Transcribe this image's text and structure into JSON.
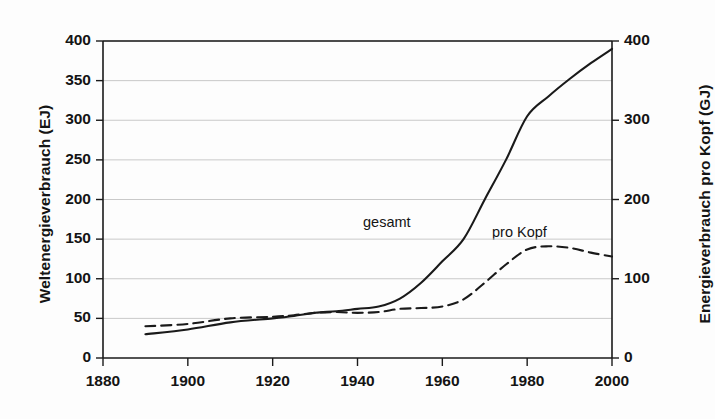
{
  "chart_data": {
    "type": "line",
    "title": "",
    "subtitle": "",
    "xlabel": "",
    "ylabel": "Weltenergieverbrauch (EJ)",
    "ylabel_right": "Energieverbrauch pro Kopf (GJ)",
    "xlim": [
      1880,
      2000
    ],
    "ylim": [
      0,
      400
    ],
    "ylim_right": [
      0,
      400
    ],
    "grid": true,
    "legend_position": "inline-annotations",
    "xticks": [
      "1880",
      "1900",
      "1920",
      "1940",
      "1960",
      "1980",
      "2000"
    ],
    "xtick_values": [
      1880,
      1900,
      1920,
      1940,
      1960,
      1980,
      2000
    ],
    "yticks_left": [
      "0",
      "50",
      "100",
      "150",
      "200",
      "250",
      "300",
      "350",
      "400"
    ],
    "ytick_values_left": [
      0,
      50,
      100,
      150,
      200,
      250,
      300,
      350,
      400
    ],
    "yticks_right": [
      "0",
      "100",
      "200",
      "300",
      "400"
    ],
    "ytick_values_right": [
      0,
      100,
      200,
      300,
      400
    ],
    "series": [
      {
        "name": "gesamt",
        "label": "gesamt",
        "axis": "left",
        "unit": "EJ",
        "style": "solid",
        "color": "#1a1a1a",
        "x": [
          1890,
          1900,
          1910,
          1920,
          1925,
          1930,
          1935,
          1940,
          1945,
          1950,
          1955,
          1960,
          1965,
          1970,
          1975,
          1980,
          1985,
          1990,
          1995,
          2000
        ],
        "values": [
          30,
          36,
          45,
          50,
          53,
          57,
          59,
          62,
          65,
          75,
          95,
          122,
          150,
          200,
          250,
          305,
          330,
          352,
          372,
          390
        ]
      },
      {
        "name": "pro Kopf",
        "label": "pro Kopf",
        "axis": "right",
        "unit": "GJ",
        "style": "dashed",
        "color": "#1a1a1a",
        "x": [
          1890,
          1900,
          1910,
          1920,
          1925,
          1930,
          1935,
          1940,
          1945,
          1950,
          1955,
          1960,
          1965,
          1970,
          1975,
          1980,
          1985,
          1990,
          1995,
          2000
        ],
        "values": [
          40,
          43,
          50,
          52,
          54,
          57,
          58,
          57,
          58,
          62,
          63,
          65,
          74,
          95,
          118,
          137,
          141,
          139,
          133,
          128
        ]
      }
    ],
    "annotations": [
      {
        "text": "gesamt",
        "x_px": 363,
        "y_px": 214
      },
      {
        "text": "pro Kopf",
        "x_px": 492,
        "y_px": 224
      }
    ]
  },
  "colors": {
    "background": "#fdfdfd",
    "axis": "#1a1a1a",
    "grid": "#c9c9c9",
    "series_total": "#1a1a1a",
    "series_per_capita": "#1a1a1a"
  }
}
